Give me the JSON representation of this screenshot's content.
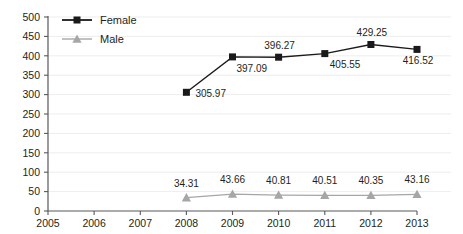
{
  "chart_data": {
    "type": "line",
    "title": "",
    "xlabel": "",
    "ylabel": "",
    "categories": [
      "2005",
      "2006",
      "2007",
      "2008",
      "2009",
      "2010",
      "2011",
      "2012",
      "2013"
    ],
    "ylim": [
      0,
      500
    ],
    "yticks": [
      "0",
      "50",
      "100",
      "150",
      "200",
      "250",
      "300",
      "350",
      "400",
      "450",
      "500"
    ],
    "grid": true,
    "legend_position": "top-left",
    "series": [
      {
        "name": "Female",
        "color": "#1a1a1a",
        "marker": "square",
        "x": [
          "2008",
          "2009",
          "2010",
          "2011",
          "2012",
          "2013"
        ],
        "values": [
          305.97,
          397.09,
          396.27,
          405.55,
          429.25,
          416.52
        ],
        "labels": [
          "305.97",
          "397.09",
          "396.27",
          "405.55",
          "429.25",
          "416.52"
        ]
      },
      {
        "name": "Male",
        "color": "#a6a6a6",
        "marker": "triangle",
        "x": [
          "2008",
          "2009",
          "2010",
          "2011",
          "2012",
          "2013"
        ],
        "values": [
          34.31,
          43.66,
          40.81,
          40.51,
          40.35,
          43.16
        ],
        "labels": [
          "34.31",
          "43.66",
          "40.81",
          "40.51",
          "40.35",
          "43.16"
        ]
      }
    ],
    "legend": [
      {
        "label": "Female",
        "color": "#1a1a1a",
        "marker": "square"
      },
      {
        "label": "Male",
        "color": "#a6a6a6",
        "marker": "triangle"
      }
    ]
  }
}
